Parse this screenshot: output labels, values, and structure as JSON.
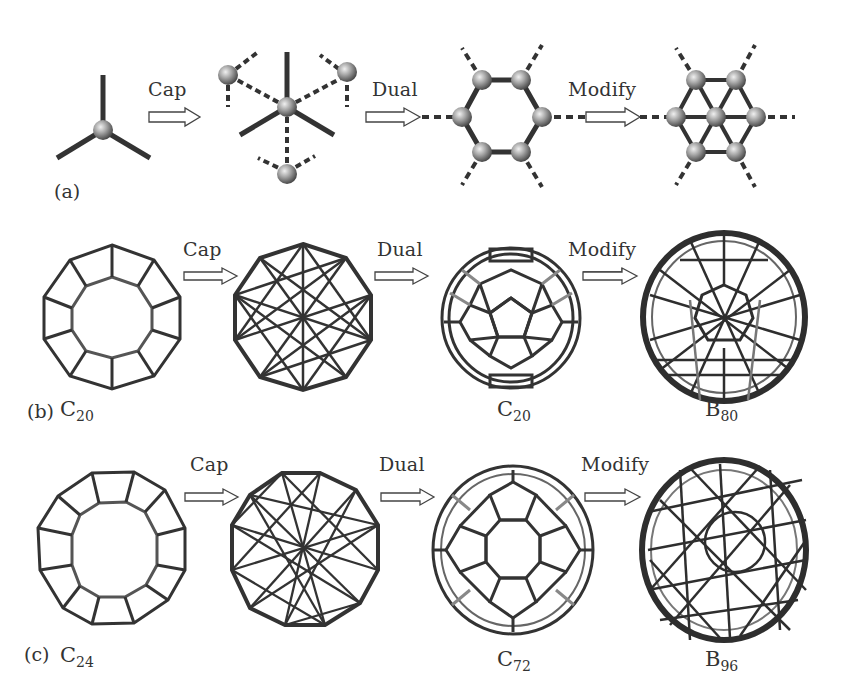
{
  "figure": {
    "rows": [
      {
        "id": "a",
        "label": "(a)",
        "operations": [
          "Cap",
          "Dual",
          "Modify"
        ],
        "stages": [
          {
            "name": "three-connected-vertex"
          },
          {
            "name": "capped-vertex"
          },
          {
            "name": "hexagon-dual"
          },
          {
            "name": "filled-hexagon"
          }
        ]
      },
      {
        "id": "b",
        "label": "(b)",
        "operations": [
          "Cap",
          "Dual",
          "Modify"
        ],
        "stages": [
          {
            "name": "dodecahedron",
            "formula_main": "C",
            "formula_sub": "20"
          },
          {
            "name": "capped-polyhedron-b"
          },
          {
            "name": "dual-cage-b",
            "formula_main": "C",
            "formula_sub": "20"
          },
          {
            "name": "boron-cage-b",
            "formula_main": "B",
            "formula_sub": "80"
          }
        ]
      },
      {
        "id": "c",
        "label": "(c)",
        "operations": [
          "Cap",
          "Dual",
          "Modify"
        ],
        "stages": [
          {
            "name": "cage-c24",
            "formula_main": "C",
            "formula_sub": "24"
          },
          {
            "name": "capped-polyhedron-c"
          },
          {
            "name": "dual-cage-c",
            "formula_main": "C",
            "formula_sub": "72"
          },
          {
            "name": "boron-cage-c",
            "formula_main": "B",
            "formula_sub": "96"
          }
        ]
      }
    ],
    "colors": {
      "edge_front": "#2e2e2e",
      "edge_back": "#8a8a8a",
      "atom_light": "#d8d8d8",
      "atom_dark": "#5a5a5a",
      "arrow_stroke": "#444444",
      "background": "#ffffff"
    }
  }
}
